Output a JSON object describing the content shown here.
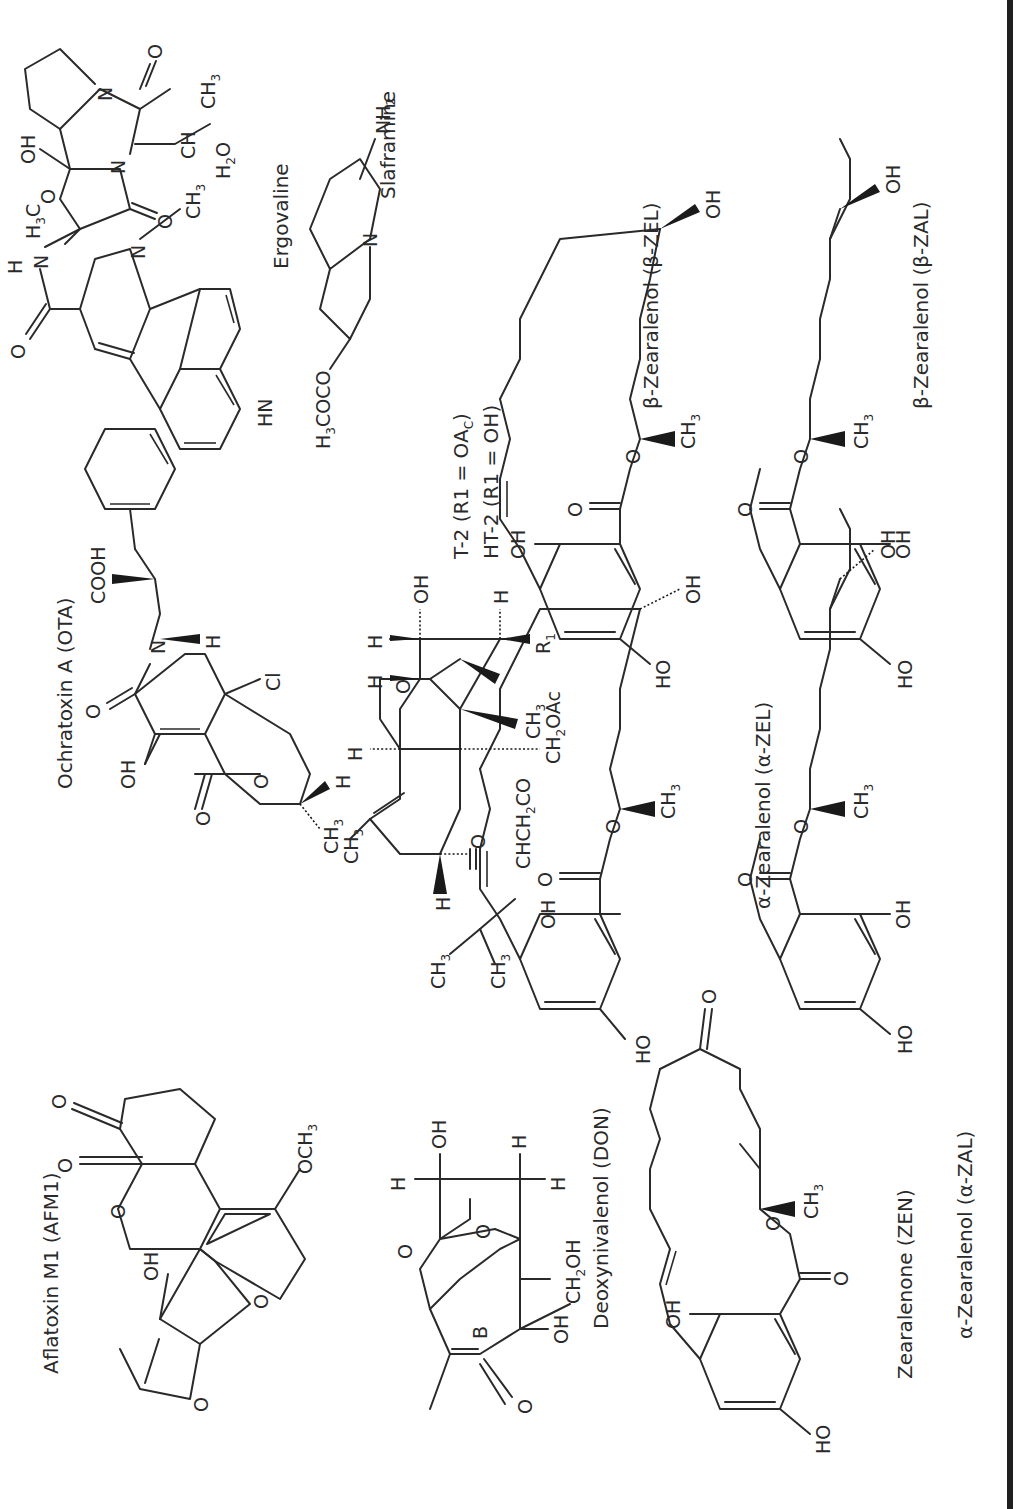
{
  "figure": {
    "orientation": "rotated -90deg (text reads bottom-to-top)",
    "compounds": [
      {
        "id": "afm1",
        "label": "Aflatoxin M1 (AFM1)",
        "atoms": [
          "O",
          "O",
          "O",
          "OH",
          "OCH3",
          "O",
          "O"
        ]
      },
      {
        "id": "ota",
        "label": "Ochratoxin A (OTA)",
        "atoms": [
          "COOH",
          "N",
          "H",
          "O",
          "OH",
          "O",
          "O",
          "CH3",
          "H",
          "Cl"
        ]
      },
      {
        "id": "ergovaline",
        "label": "Ergovaline",
        "atoms": [
          "O",
          "H",
          "N",
          "H3C",
          "O",
          "OH",
          "N",
          "N",
          "O",
          "O",
          "CH",
          "CH3",
          "H2O",
          "N",
          "CH3",
          "HN"
        ]
      },
      {
        "id": "t2",
        "label_line1": "T-2 (R1 = OAc)",
        "label_line2": "HT-2 (R1 = OH)",
        "atoms": [
          "H",
          "H",
          "H",
          "O",
          "OH",
          "O",
          "H",
          "R1",
          "CH3",
          "CH2OAc",
          "CH3",
          "H",
          "O",
          "CHCH2CO",
          "CH3",
          "CH3"
        ]
      },
      {
        "id": "slaframine",
        "label": "Slaframine",
        "atoms": [
          "H3COCO",
          "N",
          "NH2"
        ]
      },
      {
        "id": "don",
        "label": "Deoxynivalenol (DON)",
        "atoms": [
          "H",
          "OH",
          "H",
          "H",
          "O",
          "O",
          "B",
          "O",
          "OH",
          "CH2OH"
        ]
      },
      {
        "id": "a-zel",
        "label": "α-Zearalenol (α-ZEL)",
        "atoms": [
          "OH",
          "O",
          "O",
          "CH3",
          "OH",
          "HO"
        ]
      },
      {
        "id": "b-zel",
        "label": "β-Zearalenol (β-ZEL)",
        "atoms": [
          "OH",
          "O",
          "O",
          "CH3",
          "OH",
          "HO"
        ]
      },
      {
        "id": "zen",
        "label": "Zearalenone (ZEN)",
        "atoms": [
          "OH",
          "O",
          "O",
          "CH3",
          "O",
          "HO"
        ]
      },
      {
        "id": "a-zal",
        "label": "α-Zearalenol (α-ZAL)",
        "atoms": [
          "OH",
          "O",
          "O",
          "CH3",
          "OH",
          "HO"
        ]
      },
      {
        "id": "b-zal",
        "label": "β-Zearalenol (β-ZAL)",
        "atoms": [
          "OH",
          "O",
          "O",
          "CH3",
          "OH",
          "HO"
        ]
      }
    ]
  },
  "text": {
    "afm1": {
      "label": "Aflatoxin M1 (AFM1)",
      "oh": "OH",
      "och3": "OCH",
      "och3_sub": "3",
      "o": "O"
    },
    "ota": {
      "label": "Ochratoxin A (OTA)",
      "cooh": "COOH",
      "n": "N",
      "h": "H",
      "o": "O",
      "oh": "OH",
      "cl": "Cl",
      "ch3": "CH",
      "sub3": "3"
    },
    "ergo": {
      "label": "Ergovaline",
      "o": "O",
      "h": "H",
      "n": "N",
      "hn": "HN",
      "h3c": "H",
      "h3c_sub": "3",
      "h3c_c": "C",
      "oh": "OH",
      "ch": "CH",
      "ch3": "CH",
      "sub3": "3",
      "h2o": "H",
      "h2o_sub": "2",
      "h2o_o": "O"
    },
    "t2": {
      "line1": "T-2 (R1 = OA",
      "line1_sub": "C",
      "line1_end": ")",
      "line2": "HT-2 (R1 = OH)",
      "h": "H",
      "o": "O",
      "oh": "OH",
      "r": "R",
      "r_sub": "1",
      "ch3": "CH",
      "sub3": "3",
      "ch2oac": "CH",
      "ch2oac_sub": "2",
      "ch2oac_end": "OAc",
      "chch2co": "CHCH",
      "chch2co_sub": "2",
      "chch2co_end": "CO"
    },
    "slaf": {
      "label": "Slaframine",
      "h3coco": "H",
      "h3coco_sub": "3",
      "h3coco_end": "COCO",
      "n": "N",
      "nh2": "NH",
      "nh2_sub": "2"
    },
    "don": {
      "label": "Deoxynivalenol (DON)",
      "h": "H",
      "oh": "OH",
      "o": "O",
      "b": "B",
      "ch2oh": "CH",
      "ch2oh_sub": "2",
      "ch2oh_end": "OH"
    },
    "zel": {
      "oh": "OH",
      "ho": "HO",
      "o": "O",
      "ch3": "CH",
      "sub3": "3"
    },
    "labels": {
      "a_zel": "α-Zearalenol (α-ZEL)",
      "b_zel": "β-Zearalenol (β-ZEL)",
      "zen": "Zearalenone (ZEN)",
      "a_zal": "α-Zearalenol (α-ZAL)",
      "b_zal": "β-Zearalenol (β-ZAL)"
    }
  },
  "colors": {
    "ink": "#2a2a2a",
    "background": "#ffffff",
    "border": "#1f1f1f"
  }
}
